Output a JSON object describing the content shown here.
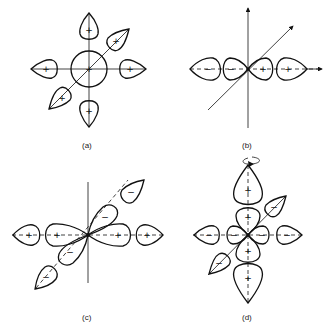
{
  "panels": [
    {
      "id": "a",
      "label": "(a)",
      "description": "Central sphere with six surrounding teardrop lobes",
      "center_sign": "+",
      "lobe_signs": {
        "up": "+",
        "down": "+",
        "left": "+",
        "right": "+",
        "upper_right": "+",
        "lower_left": "+"
      }
    },
    {
      "id": "b",
      "label": "(b)",
      "description": "Four lobes along horizontal axis with 3D axes",
      "lobe_signs": [
        "−",
        "−",
        "+",
        "+"
      ]
    },
    {
      "id": "c",
      "label": "(c)",
      "description": "Hybrid lobes along horizontal and diagonal axes",
      "horizontal_signs": [
        "+",
        "+",
        "+",
        "+"
      ],
      "diagonal_signs": [
        "−",
        "−",
        "−",
        "−"
      ]
    },
    {
      "id": "d",
      "label": "(d)",
      "description": "Cross-shaped lobes with rotation arrow",
      "vertical_signs": [
        "+",
        "+",
        "+",
        "+"
      ],
      "horizontal_signs": [
        "−",
        "−",
        "−",
        "−"
      ],
      "diagonal_signs": [
        "−",
        "−"
      ]
    }
  ],
  "colors": {
    "stroke": "#111111",
    "background": "#ffffff"
  }
}
